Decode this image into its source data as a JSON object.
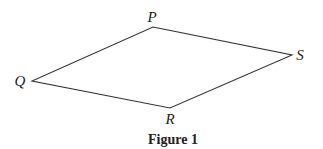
{
  "figure": {
    "caption": "Figure 1",
    "shape": "quadrilateral",
    "vertices": [
      {
        "name": "P",
        "x": 153,
        "y": 27,
        "label_x": 152,
        "label_y": 22
      },
      {
        "name": "S",
        "x": 292,
        "y": 55,
        "label_x": 300,
        "label_y": 60
      },
      {
        "name": "R",
        "x": 170,
        "y": 108,
        "label_x": 170,
        "label_y": 124
      },
      {
        "name": "Q",
        "x": 32,
        "y": 81,
        "label_x": 20,
        "label_y": 86
      }
    ],
    "stroke_color": "#333333"
  }
}
